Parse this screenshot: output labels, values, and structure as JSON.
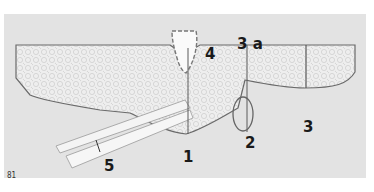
{
  "figure": {
    "number": "81"
  },
  "callouts": [
    {
      "id": "1",
      "text": "1",
      "x": 186,
      "y": 150
    },
    {
      "id": "2",
      "text": "2",
      "x": 244,
      "y": 136
    },
    {
      "id": "3",
      "text": "3",
      "x": 303,
      "y": 120
    },
    {
      "id": "3a",
      "text": "3 a",
      "x": 237,
      "y": 37
    },
    {
      "id": "4",
      "text": "4",
      "x": 205,
      "y": 47
    },
    {
      "id": "5",
      "text": "5",
      "x": 104,
      "y": 159
    }
  ],
  "colors": {
    "background": "#ffffff",
    "panel": "#e3e3e3",
    "fabric": "#efefef",
    "outline": "#6a6a6a",
    "line": "#5a5a5a",
    "text": "#1a1a1a"
  }
}
